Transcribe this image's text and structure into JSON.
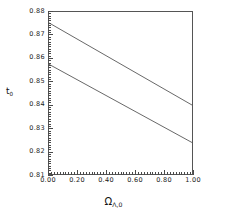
{
  "chart_data": {
    "type": "line",
    "title": "",
    "xlabel": "ΩΛ,0",
    "xlabel_symbol": "Ω",
    "xlabel_subscript": "Λ,0",
    "ylabel": "t0",
    "ylabel_symbol": "t",
    "ylabel_subscript": "0",
    "xlim": [
      0.0,
      1.0
    ],
    "ylim": [
      0.81,
      0.88
    ],
    "xticks": [
      0.0,
      0.2,
      0.4,
      0.6,
      0.8,
      1.0
    ],
    "xticklabels": [
      "0.00",
      "0.20",
      "0.40",
      "0.60",
      "0.80",
      "1.00"
    ],
    "yticks": [
      0.81,
      0.82,
      0.83,
      0.84,
      0.85,
      0.86,
      0.87,
      0.88
    ],
    "yticklabels": [
      "0.81",
      "0.82",
      "0.83",
      "0.84",
      "0.85",
      "0.86",
      "0.87",
      "0.88"
    ],
    "x_minor_ticks_per_interval": 10,
    "y_minor_ticks_per_interval": 10,
    "grid": false,
    "legend": "none",
    "frame": true,
    "line_color": "#555555",
    "series": [
      {
        "name": "upper",
        "x": [
          0.0,
          1.0
        ],
        "y": [
          0.8753,
          0.8398
        ]
      },
      {
        "name": "lower",
        "x": [
          0.0,
          1.0
        ],
        "y": [
          0.8574,
          0.8236
        ]
      }
    ]
  },
  "figure": {
    "background": "#ffffff",
    "axes_color": "#555555",
    "text_color": "#1a1a1a"
  }
}
